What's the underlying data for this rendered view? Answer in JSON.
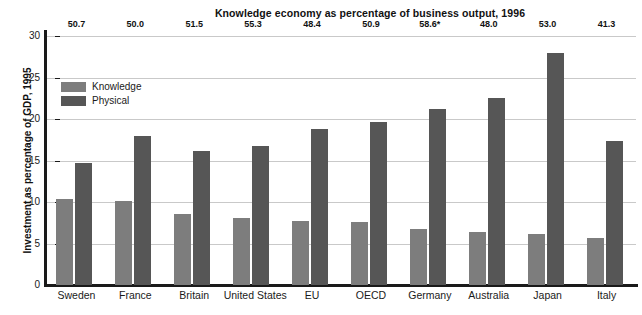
{
  "chart_data": {
    "type": "bar",
    "title": "Knowledge economy as percentage of business output, 1996",
    "xlabel": "",
    "ylabel": "Investment as percentage of GDP, 1995",
    "ylim": [
      0,
      30
    ],
    "yticks": [
      "0",
      "5",
      "10",
      "15",
      "20",
      "25",
      "30"
    ],
    "grid": true,
    "legend_position": "inside-top-left",
    "categories": [
      "Sweden",
      "France",
      "Britain",
      "United States",
      "EU",
      "OECD",
      "Germany",
      "Australia",
      "Japan",
      "Italy"
    ],
    "series": [
      {
        "name": "Knowledge",
        "color": "#7d7d7d",
        "values": [
          10.4,
          10.1,
          8.5,
          8.1,
          7.7,
          7.6,
          6.7,
          6.4,
          6.2,
          5.7
        ]
      },
      {
        "name": "Physical",
        "color": "#565656",
        "values": [
          14.7,
          17.9,
          16.2,
          16.8,
          18.8,
          19.7,
          21.2,
          22.5,
          28.0,
          17.4
        ]
      }
    ],
    "annotations": {
      "top_row_label": "Knowledge economy as percentage of business output, 1996",
      "top_row_values": [
        "50.7",
        "50.0",
        "51.5",
        "55.3",
        "48.4",
        "50.9",
        "58.6*",
        "48.0",
        "53.0",
        "41.3"
      ]
    }
  },
  "legend": {
    "entries": [
      {
        "label": "Knowledge",
        "color": "#7d7d7d"
      },
      {
        "label": "Physical",
        "color": "#565656"
      }
    ]
  }
}
